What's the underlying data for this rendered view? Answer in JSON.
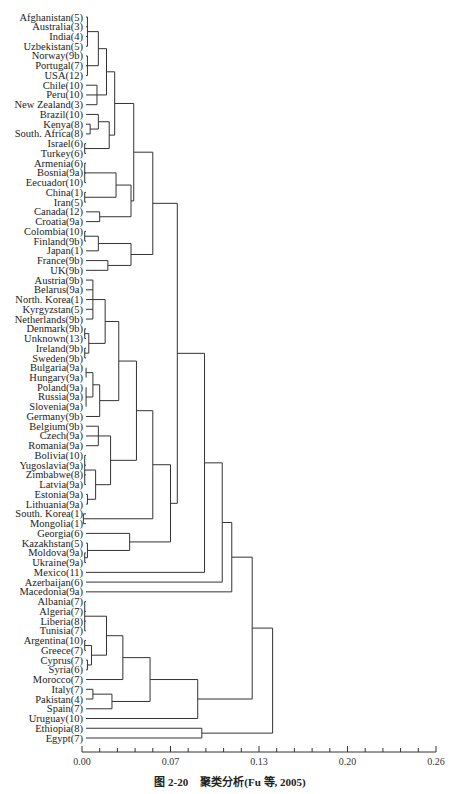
{
  "chart_data": {
    "type": "dendrogram",
    "title": "",
    "caption": {
      "figure_no": "图 2-20",
      "text": "聚类分析(Fu 等, 2005)"
    },
    "xlabel": "",
    "ylabel": "",
    "xlim": [
      0.0,
      0.26
    ],
    "x_ticks": [
      "0.00",
      "0.07",
      "0.13",
      "0.20",
      "0.26"
    ],
    "leaves": [
      "Afghanistan(5)",
      "Australia(3)",
      "India(4)",
      "Uzbekistan(5)",
      "Norway(9b)",
      "Portugal(7)",
      "USA(12)",
      "Chile(10)",
      "Peru(10)",
      "New Zealand(3)",
      "Brazil(10)",
      "Kenya(8)",
      "South. Africa(8)",
      "Israel(6)",
      "Turkey(6)",
      "Armenia(6)",
      "Bosnia(9a)",
      "Eecuador(10)",
      "China(1)",
      "Iran(5)",
      "Canada(12)",
      "Croatia(9a)",
      "Colombia(10)",
      "Finland(9b)",
      "Japan(1)",
      "France(9b)",
      "UK(9b)",
      "Austria(9b)",
      "Belarus(9a)",
      "North. Korea(1)",
      "Kyrgyzstan(5)",
      "Netherlands(9b)",
      "Denmark(9b)",
      "Unknown(13)",
      "Ireland(9b)",
      "Sweden(9b)",
      "Bulgaria(9a)",
      "Hungary(9a)",
      "Poland(9a)",
      "Russia(9a)",
      "Slovenia(9a)",
      "Germany(9b)",
      "Belgium(9b)",
      "Czech(9a)",
      "Romania(9a)",
      "Bolivia(10)",
      "Yugoslavia(9a)",
      "Zimbabwe(8)",
      "Latvia(9a)",
      "Estonia(9a)",
      "Lithuania(9a)",
      "South. Korea(1)",
      "Mongolia(1)",
      "Georgia(6)",
      "Kazakhstan(5)",
      "Moldova(9a)",
      "Ukraine(9a)",
      "Mexico(11)",
      "Azerbaijan(6)",
      "Macedonia(9a)",
      "Albania(7)",
      "Algeria(7)",
      "Liberia(8)",
      "Tunisia(7)",
      "Argentina(10)",
      "Greece(7)",
      "Cyprus(7)",
      "Syria(6)",
      "Morocco(7)",
      "Italy(7)",
      "Pakistan(4)",
      "Spain(7)",
      "Uruguay(10)",
      "Ethiopia(8)",
      "Egypt(7)"
    ],
    "merges_px": [
      {
        "group": "Afghanistan..Uzbekistan",
        "x": 88
      },
      {
        "group": "Norway..USA",
        "x": 89
      },
      {
        "group": "Chile..NewZealand",
        "x": 89
      },
      {
        "group": "A1",
        "x": 96
      },
      {
        "group": "A2",
        "x": 100
      },
      {
        "group": "Kenya-SAfrica",
        "x": 99
      },
      {
        "group": "Brazil+",
        "x": 107
      },
      {
        "group": "Israel-Turkey",
        "x": 88
      },
      {
        "group": "B",
        "x": 108
      },
      {
        "group": "TopNW",
        "x": 114
      }
    ],
    "grid": false,
    "legend": null
  }
}
